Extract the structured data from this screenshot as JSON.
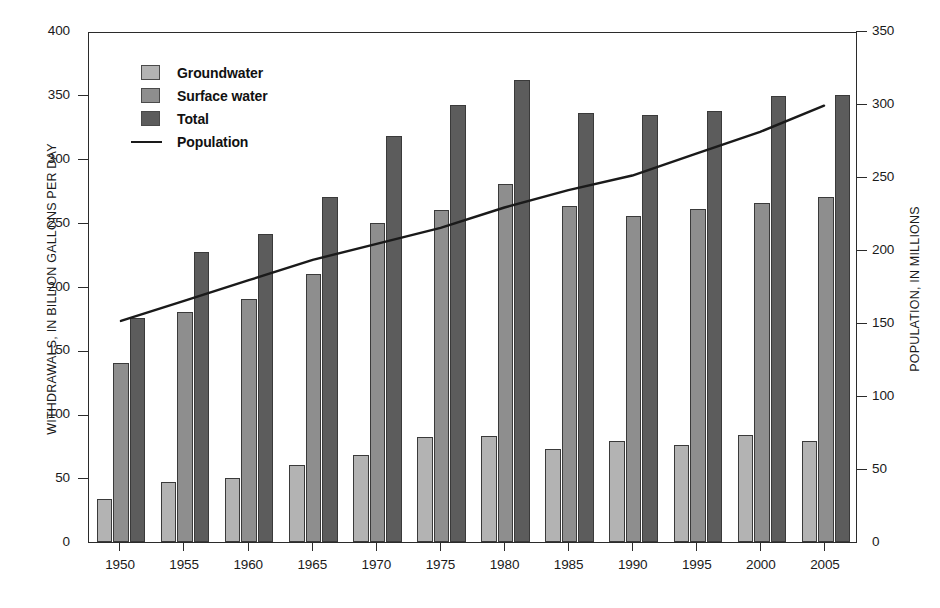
{
  "chart_data": {
    "type": "bar",
    "title": "",
    "subtitle": "",
    "xlabel": "",
    "ylabel": "WITHDRAWALS, IN BILLION GALLONS PER DAY",
    "y2label": "POPULATION, IN MILLIONS",
    "categories": [
      "1950",
      "1955",
      "1960",
      "1965",
      "1970",
      "1975",
      "1980",
      "1985",
      "1990",
      "1995",
      "2000",
      "2005"
    ],
    "ylim": [
      0,
      400
    ],
    "yticks": [
      "0",
      "50",
      "100",
      "150",
      "200",
      "250",
      "300",
      "350",
      "400"
    ],
    "y2lim": [
      0,
      350
    ],
    "y2ticks": [
      "0",
      "50",
      "100",
      "150",
      "200",
      "250",
      "300",
      "350"
    ],
    "grid": false,
    "legend_position": "upper-left",
    "series": [
      {
        "name": "Groundwater",
        "key": "gw",
        "axis": "left",
        "type": "bar",
        "color": "#b3b3b3",
        "values": [
          34,
          47,
          50,
          60,
          68,
          82,
          83,
          73,
          79,
          76,
          84,
          79
        ]
      },
      {
        "name": "Surface water",
        "key": "sw",
        "axis": "left",
        "type": "bar",
        "color": "#8e8e8e",
        "values": [
          140,
          180,
          190,
          210,
          250,
          260,
          280,
          263,
          255,
          261,
          265,
          270
        ]
      },
      {
        "name": "Total",
        "key": "tot",
        "axis": "left",
        "type": "bar",
        "color": "#5c5c5c",
        "values": [
          175,
          227,
          241,
          270,
          318,
          342,
          362,
          336,
          334,
          337,
          349,
          350
        ]
      },
      {
        "name": "Population",
        "key": "pop",
        "axis": "right",
        "type": "line",
        "color": "#1a1a1a",
        "values": [
          152,
          166,
          180,
          194,
          205,
          216,
          230,
          242,
          252,
          267,
          282,
          300
        ]
      }
    ]
  },
  "legend": {
    "items": [
      {
        "label": "Groundwater",
        "marker": "swatch",
        "key": "gw"
      },
      {
        "label": "Surface water",
        "marker": "swatch",
        "key": "sw"
      },
      {
        "label": "Total",
        "marker": "swatch",
        "key": "tot"
      },
      {
        "label": "Population",
        "marker": "line",
        "key": "pop"
      }
    ]
  },
  "colors": {
    "groundwater": "#b3b3b3",
    "surface_water": "#8e8e8e",
    "total": "#5c5c5c",
    "population_line": "#1a1a1a",
    "axis": "#2b2b2b",
    "background": "#ffffff"
  }
}
